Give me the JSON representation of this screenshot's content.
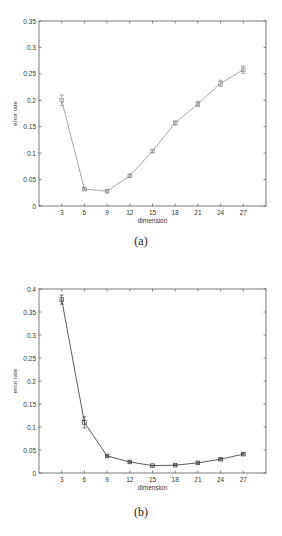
{
  "figures": [
    {
      "caption": "(a)",
      "line_color": "#9a9a9a",
      "marker_color": "#8a8a8a"
    },
    {
      "caption": "(b)",
      "line_color": "#4a4a4a",
      "marker_color": "#3a3a3a"
    }
  ],
  "chart_data": [
    {
      "type": "line",
      "title": "",
      "xlabel": "dimension",
      "ylabel": "error rate",
      "x": [
        3,
        6,
        9,
        12,
        15,
        18,
        21,
        24,
        27
      ],
      "series": [
        {
          "name": "error rate",
          "values": [
            0.2,
            0.032,
            0.028,
            0.057,
            0.104,
            0.157,
            0.193,
            0.232,
            0.258
          ],
          "error": [
            0.01,
            0.002,
            0.003,
            0.003,
            0.003,
            0.004,
            0.005,
            0.006,
            0.007
          ]
        }
      ],
      "xticks": [
        3,
        6,
        9,
        12,
        15,
        18,
        21,
        24,
        27
      ],
      "yticks": [
        "0",
        "0.05",
        "0.1",
        "0.15",
        "0.2",
        "0.25",
        "0.3",
        "0.35"
      ],
      "xlim": [
        0,
        30
      ],
      "ylim": [
        0,
        0.35
      ],
      "grid": false,
      "legend": null,
      "caption": "(a)"
    },
    {
      "type": "line",
      "title": "",
      "xlabel": "dimension",
      "ylabel": "error rate",
      "x": [
        3,
        6,
        9,
        12,
        15,
        18,
        21,
        24,
        27
      ],
      "series": [
        {
          "name": "error rate",
          "values": [
            0.377,
            0.11,
            0.037,
            0.024,
            0.016,
            0.017,
            0.022,
            0.03,
            0.041
          ],
          "error": [
            0.01,
            0.012,
            0.002,
            0.002,
            0.001,
            0.001,
            0.002,
            0.002,
            0.002
          ]
        }
      ],
      "xticks": [
        3,
        6,
        9,
        12,
        15,
        18,
        21,
        24,
        27
      ],
      "yticks": [
        "0",
        "0.05",
        "0.1",
        "0.15",
        "0.2",
        "0.25",
        "0.3",
        "0.35",
        "0.4"
      ],
      "xlim": [
        0,
        30
      ],
      "ylim": [
        0,
        0.4
      ],
      "grid": false,
      "legend": null,
      "caption": "(b)"
    }
  ]
}
